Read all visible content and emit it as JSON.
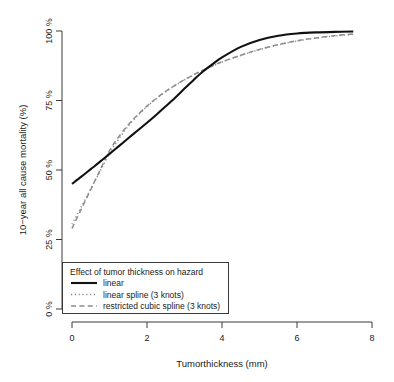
{
  "chart_data": {
    "type": "line",
    "title": "",
    "xlabel": "Tumorthickness (mm)",
    "ylabel": "10−year all cause mortality (%)",
    "xlim": [
      0,
      8
    ],
    "ylim": [
      0,
      100
    ],
    "xticks": [
      0,
      2,
      4,
      6,
      8
    ],
    "xtick_labels": [
      "0",
      "2",
      "4",
      "6",
      "8"
    ],
    "yticks": [
      0,
      25,
      50,
      75,
      100
    ],
    "ytick_labels": [
      "0 %",
      "25 %",
      "50 %",
      "75 %",
      "100 %"
    ],
    "grid": false,
    "legend_position": "bottom-left",
    "legend_title": "Effect of tumor thickness on hazard",
    "x": [
      0,
      0.25,
      0.5,
      0.75,
      1,
      1.25,
      1.5,
      1.75,
      2,
      2.25,
      2.5,
      2.75,
      3,
      3.25,
      3.5,
      3.75,
      4,
      4.5,
      5,
      5.5,
      6,
      6.5,
      7,
      7.5
    ],
    "series": [
      {
        "name": "linear",
        "style": "solid",
        "color": "#111111",
        "values": [
          45.0,
          47.6,
          50.3,
          53.0,
          55.8,
          58.6,
          61.4,
          64.2,
          67.0,
          69.9,
          72.9,
          76.0,
          79.3,
          82.5,
          85.5,
          88.1,
          90.5,
          94.3,
          96.8,
          98.3,
          99.1,
          99.5,
          99.7,
          99.8
        ]
      },
      {
        "name": "linear spline (3 knots)",
        "style": "dotted",
        "color": "#8c8c8c",
        "values": [
          30.5,
          36.8,
          43.2,
          49.6,
          56.0,
          61.2,
          65.8,
          69.6,
          72.8,
          75.6,
          78.2,
          80.4,
          82.4,
          84.2,
          85.9,
          87.4,
          88.8,
          91.2,
          93.3,
          95.0,
          96.4,
          97.4,
          98.2,
          98.8
        ]
      },
      {
        "name": "restricted cubic spline (3 knots)",
        "style": "dashed",
        "color": "#8c8c8c",
        "values": [
          29.0,
          36.0,
          43.0,
          50.0,
          57.0,
          62.0,
          66.3,
          69.8,
          73.0,
          75.8,
          78.3,
          80.5,
          82.5,
          84.3,
          86.0,
          87.5,
          88.9,
          91.3,
          93.4,
          95.1,
          96.5,
          97.5,
          98.3,
          98.9
        ]
      }
    ],
    "legend_entries": [
      {
        "label": "linear",
        "style": "solid",
        "color": "#111111"
      },
      {
        "label": "linear spline (3 knots)",
        "style": "dotted",
        "color": "#8c8c8c"
      },
      {
        "label": "restricted cubic spline (3 knots)",
        "style": "dashed",
        "color": "#8c8c8c"
      }
    ]
  },
  "axis": {
    "x_label": "Tumorthickness (mm)",
    "y_label": "10−year all cause mortality (%)",
    "x_ticks": [
      "0",
      "2",
      "4",
      "6",
      "8"
    ],
    "y_ticks": [
      "0 %",
      "25 %",
      "50 %",
      "75 %",
      "100 %"
    ]
  },
  "legend": {
    "title": "Effect of tumor thickness on hazard",
    "items": [
      {
        "label": "linear"
      },
      {
        "label": "linear spline (3 knots)"
      },
      {
        "label": "restricted cubic spline (3 knots)"
      }
    ]
  },
  "colors": {
    "solid_curve": "#111111",
    "spline_curve": "#8c8c8c",
    "axis": "#3a3a3a",
    "background": "#ffffff"
  }
}
